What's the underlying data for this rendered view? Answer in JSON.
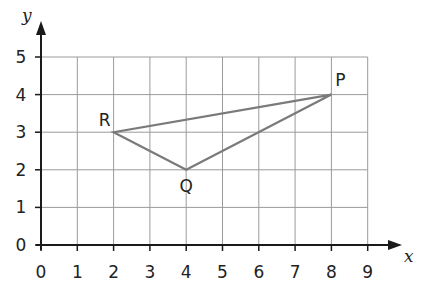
{
  "chart_data": {
    "type": "line",
    "title": "",
    "xlabel": "x",
    "ylabel": "y",
    "xlim": [
      0,
      9
    ],
    "ylim": [
      0,
      5
    ],
    "grid": true,
    "x_ticks": [
      "0",
      "1",
      "2",
      "3",
      "4",
      "5",
      "6",
      "7",
      "8",
      "9"
    ],
    "y_ticks": [
      "0",
      "1",
      "2",
      "3",
      "4",
      "5"
    ],
    "points": [
      {
        "label": "P",
        "x": 8,
        "y": 4
      },
      {
        "label": "Q",
        "x": 4,
        "y": 2
      },
      {
        "label": "R",
        "x": 2,
        "y": 3
      }
    ],
    "series": [
      {
        "name": "triangle PQR",
        "closed": true,
        "vertices": [
          "P",
          "Q",
          "R"
        ]
      }
    ],
    "colors": {
      "grid": "#9a9a9a",
      "axis": "#1a1a1a",
      "triangle": "#7a7a7a"
    }
  }
}
